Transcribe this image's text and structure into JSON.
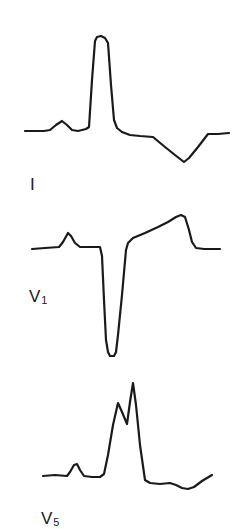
{
  "figure": {
    "stroke_color": "#1a1a1a",
    "background": "#ffffff"
  },
  "leads": [
    {
      "name": "I",
      "label_main": "I",
      "label_sub": "",
      "points": "25,131 44,131 50,130 56,125 62,121 67,125 72,130 78,131 86,129 89,127 92,80 95,41 97,37 101,36 105,38 108,43 111,85 114,120 117,128 122,132 130,135 140,136 153,137 165,147 175,155 184,162 189,158 198,147 208,134 218,134 229,133"
    },
    {
      "name": "V1",
      "label_main": "V",
      "label_sub": "1",
      "points": "32,249 45,248 59,247 63,242 68,233 71,236 75,243 80,247 90,247 100,247 102,256 104,300 106,340 108,352 110,356 114,356 116,352 118,335 122,295 126,250 128,243 133,238 145,233 158,227 168,222 176,217 181,215 185,217 189,230 192,242 196,248 204,249 220,249"
    },
    {
      "name": "V5",
      "label_main": "V",
      "label_sub": "5",
      "points": "43,476 55,475 67,476 70,472 74,465 77,464 80,470 84,476 92,477 100,477 104,474 108,455 113,425 118,403 122,412 127,424 130,402 133,383 136,405 140,445 145,480 150,483 160,484 170,483 176,485 182,488 188,489 194,487 202,481 212,475"
    }
  ],
  "labels": {
    "lead_I": {
      "main": "I",
      "sub": ""
    },
    "lead_V1": {
      "main": "V",
      "sub": "1"
    },
    "lead_V5": {
      "main": "V",
      "sub": "5"
    }
  }
}
